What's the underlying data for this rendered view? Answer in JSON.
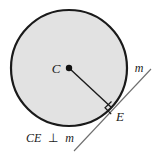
{
  "figure": {
    "type": "geometry-diagram",
    "background_color": "#ffffff",
    "circle": {
      "name": "circle-shape",
      "center_label": "C",
      "center_x": 69,
      "center_y": 68,
      "radius": 58,
      "fill_color": "#e2e2e2",
      "stroke_color": "#1a1a1a",
      "stroke_width": 2.2
    },
    "center_point": {
      "name": "center-dot",
      "label": "C",
      "label_x": 58,
      "label_y": 72,
      "dot_x": 69,
      "dot_y": 68,
      "dot_radius": 3.2,
      "color": "#111111"
    },
    "tangent_point": {
      "name": "tangency-point-e",
      "label": "E",
      "label_x": 118,
      "label_y": 119,
      "point_x": 112,
      "point_y": 108,
      "color": "#1a1a1a"
    },
    "radius_segment": {
      "name": "radius-segment-ce",
      "from_x": 69,
      "from_y": 68,
      "to_x": 112,
      "to_y": 108,
      "stroke_color": "#1a1a1a",
      "stroke_width": 1.4
    },
    "tangent_line": {
      "name": "tangent-line-m",
      "label": "m",
      "label_x": 137,
      "label_y": 71,
      "from_x": 74,
      "from_y": 151,
      "to_x": 151,
      "to_y": 69,
      "stroke_color": "#6e6e6e",
      "stroke_width": 1.1
    },
    "right_angle_marker": {
      "name": "right-angle-marker",
      "size": 9,
      "stroke_color": "#1a1a1a",
      "stroke_width": 1.2,
      "vertex_x": 112,
      "vertex_y": 108
    },
    "caption": {
      "name": "figure-caption",
      "text": "CE ⊥ m",
      "segment_label": "CE",
      "perp_symbol": "⊥",
      "line_label": "m",
      "x": 26,
      "y": 141
    }
  }
}
